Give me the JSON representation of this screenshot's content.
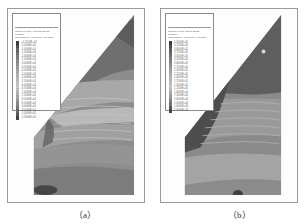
{
  "figure": {
    "panels": [
      {
        "id": "a",
        "caption": "（a）",
        "legend": {
          "title_line1": "Contour of Max. Principal Stress",
          "title_line2": "Plasticity",
          "title_line3": "Calculated by: Volumetric Averaging",
          "values": [
            "+1.5503E+03",
            "-5.0000E+03",
            "-1.0000E+04",
            "-1.5000E+04",
            "-2.0000E+04",
            "-2.5000E+04",
            "-3.0000E+04",
            "-3.5000E+04",
            "-4.0000E+04",
            "-4.5000E+04",
            "-5.0000E+04",
            "-5.5000E+04",
            "-6.0000E+04",
            "-6.5000E+04",
            "-7.0000E+04",
            "-7.5000E+04",
            "-8.0000E+04",
            "-8.5000E+04",
            "-9.0000E+04",
            "-9.5000E+04",
            "-1.0000E+05",
            "-1.0500E+05"
          ],
          "colors": [
            "#3a3a3a",
            "#505050",
            "#626262",
            "#6e6e6e",
            "#7a7a7a",
            "#868686",
            "#909090",
            "#9a9a9a",
            "#a4a4a4",
            "#adadad",
            "#b5b5b5",
            "#bdbdbd",
            "#c4c4c4",
            "#bababa",
            "#b0b0b0",
            "#a2a2a2",
            "#949494",
            "#858585",
            "#767676",
            "#666666",
            "#565656",
            "#444444"
          ]
        }
      },
      {
        "id": "b",
        "caption": "（b）",
        "legend": {
          "title_line1": "Contour of Max. Shear Stress",
          "title_line2": "Plasticity",
          "title_line3": "Calculated by: Volumetric Averaging",
          "values": [
            "4.5000E+05",
            "4.2500E+05",
            "4.0000E+05",
            "3.7500E+05",
            "3.5000E+05",
            "3.2500E+05",
            "3.0000E+05",
            "2.7500E+05",
            "2.5000E+05",
            "2.2500E+05",
            "2.0000E+05",
            "1.7500E+05",
            "1.5000E+05",
            "1.2500E+05",
            "1.0000E+05",
            "7.5000E+04",
            "5.0000E+04",
            "2.5000E+04",
            "1.0000E+04",
            "5.0000E+03"
          ],
          "colors": [
            "#3a3a3a",
            "#4c4c4c",
            "#5c5c5c",
            "#6a6a6a",
            "#767676",
            "#828282",
            "#8c8c8c",
            "#969696",
            "#a0a0a0",
            "#aaaaaa",
            "#b3b3b3",
            "#bbbbbb",
            "#c3c3c3",
            "#b8b8b8",
            "#a8a8a8",
            "#969696",
            "#848484",
            "#707070",
            "#5a5a5a",
            "#444444"
          ]
        }
      }
    ]
  }
}
